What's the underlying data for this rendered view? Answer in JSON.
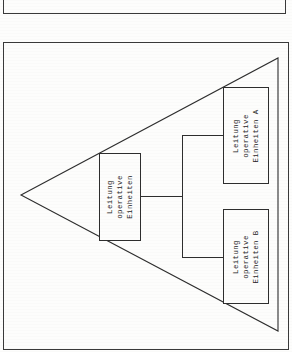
{
  "figure": {
    "kind": "organizational-chart",
    "shape": "triangle",
    "top_frame_present": true,
    "line_color": "#2e2e2e",
    "background_color": "#fdfdfc",
    "text_color": "#242424",
    "text_orientation": "rotated-90-ccw"
  },
  "nodes": {
    "root": {
      "id": "leitung-operative-einheiten",
      "lines": [
        "Leitung",
        "operative",
        "Einheiten"
      ]
    },
    "unit_a": {
      "id": "leitung-operative-einheiten-a",
      "lines": [
        "Leitung",
        "operative",
        "Einheiten  A"
      ]
    },
    "unit_b": {
      "id": "leitung-operative-einheiten-b",
      "lines": [
        "Leitung",
        "operative",
        "Einheiten  B"
      ]
    }
  },
  "connectors": [
    {
      "from": "root",
      "to": "bus"
    },
    {
      "from": "bus",
      "to": "unit_a"
    },
    {
      "from": "bus",
      "to": "unit_b"
    }
  ]
}
